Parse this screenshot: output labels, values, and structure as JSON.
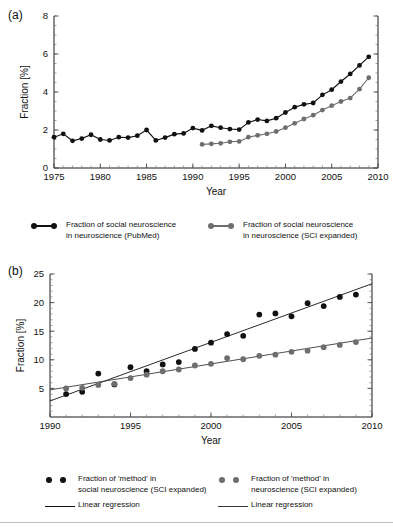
{
  "figure": {
    "panel_a_label": "(a)",
    "panel_b_label": "(b)"
  },
  "legend_a": {
    "items": [
      {
        "name": "legend-pubmed",
        "symbol": "line-with-dots",
        "color": "#111111",
        "label": "Fraction of social neuroscience\nin neuroscience (PubMed)"
      },
      {
        "name": "legend-sci-expanded",
        "symbol": "line-with-dots",
        "color": "#6e6e6e",
        "label": "Fraction of social neuroscience\nin neuroscience (SCI expanded)"
      }
    ]
  },
  "legend_b": {
    "items": [
      {
        "name": "legend-method-social",
        "symbol": "two-dots",
        "color": "#111111",
        "label": "Fraction of 'method' in\nsocial neuroscience (SCI expanded)"
      },
      {
        "name": "legend-method-neuro",
        "symbol": "two-dots",
        "color": "#6e6e6e",
        "label": "Fraction of 'method' in\nneuroscience (SCI expanded)"
      }
    ],
    "regression_items": [
      {
        "name": "legend-regression-social",
        "symbol": "line",
        "color": "#111111",
        "label": "Linear regression"
      },
      {
        "name": "legend-regression-neuro",
        "symbol": "line",
        "color": "#3a3a3a",
        "label": "Linear regression"
      }
    ]
  },
  "chart_data": [
    {
      "id": "panel-a",
      "type": "line",
      "title": "",
      "xlabel": "Year",
      "ylabel": "Fraction [%]",
      "xlim": [
        1975,
        2010
      ],
      "ylim": [
        0,
        8
      ],
      "xticks": [
        1975,
        1980,
        1985,
        1990,
        1995,
        2000,
        2005,
        2010
      ],
      "yticks": [
        0,
        2,
        4,
        6,
        8
      ],
      "xminor_step": 1,
      "yminor_step": 0.5,
      "grid": false,
      "legend_position": "below",
      "series": [
        {
          "name": "Fraction of social neuroscience in neuroscience (PubMed)",
          "color": "#111111",
          "marker": "circle",
          "x": [
            1975,
            1976,
            1977,
            1978,
            1979,
            1980,
            1981,
            1982,
            1983,
            1984,
            1985,
            1986,
            1987,
            1988,
            1989,
            1990,
            1991,
            1992,
            1993,
            1994,
            1995,
            1996,
            1997,
            1998,
            1999,
            2000,
            2001,
            2002,
            2003,
            2004,
            2005,
            2006,
            2007,
            2008,
            2009
          ],
          "y": [
            1.62,
            1.8,
            1.43,
            1.55,
            1.75,
            1.5,
            1.45,
            1.62,
            1.6,
            1.7,
            2.0,
            1.45,
            1.6,
            1.78,
            1.82,
            2.1,
            1.98,
            2.22,
            2.12,
            2.05,
            2.02,
            2.4,
            2.55,
            2.48,
            2.62,
            2.92,
            3.2,
            3.35,
            3.42,
            3.85,
            4.12,
            4.55,
            4.95,
            5.4,
            5.85
          ]
        },
        {
          "name": "Fraction of social neuroscience in neuroscience (SCI expanded)",
          "color": "#6e6e6e",
          "marker": "circle",
          "x": [
            1991,
            1992,
            1993,
            1994,
            1995,
            1996,
            1997,
            1998,
            1999,
            2000,
            2001,
            2002,
            2003,
            2004,
            2005,
            2006,
            2007,
            2008,
            2009
          ],
          "y": [
            1.24,
            1.27,
            1.3,
            1.38,
            1.4,
            1.62,
            1.72,
            1.8,
            1.92,
            2.12,
            2.35,
            2.58,
            2.78,
            3.05,
            3.28,
            3.5,
            3.68,
            4.15,
            4.75
          ]
        }
      ]
    },
    {
      "id": "panel-b",
      "type": "scatter",
      "title": "",
      "xlabel": "Year",
      "ylabel": "Fraction [%]",
      "xlim": [
        1990,
        2010
      ],
      "ylim": [
        0,
        25
      ],
      "xticks": [
        1990,
        1995,
        2000,
        2005,
        2010
      ],
      "yticks": [
        5,
        10,
        15,
        20,
        25
      ],
      "xminor_step": 1,
      "yminor_step": 1,
      "grid": false,
      "legend_position": "below",
      "series": [
        {
          "name": "Fraction of 'method' in social neuroscience (SCI expanded)",
          "color": "#111111",
          "marker": "circle",
          "x": [
            1991,
            1992,
            1993,
            1994,
            1995,
            1996,
            1997,
            1998,
            1999,
            2000,
            2001,
            2002,
            2003,
            2004,
            2005,
            2006,
            2007,
            2008,
            2009
          ],
          "y": [
            4.0,
            4.4,
            7.6,
            5.7,
            8.7,
            8.0,
            9.2,
            9.6,
            11.9,
            13.0,
            14.5,
            14.2,
            17.9,
            18.1,
            17.6,
            19.9,
            19.4,
            21.0,
            21.4
          ]
        },
        {
          "name": "Fraction of 'method' in neuroscience (SCI expanded)",
          "color": "#6e6e6e",
          "marker": "circle",
          "x": [
            1991,
            1992,
            1993,
            1994,
            1995,
            1996,
            1997,
            1998,
            1999,
            2000,
            2001,
            2002,
            2003,
            2004,
            2005,
            2006,
            2007,
            2008,
            2009
          ],
          "y": [
            5.0,
            5.1,
            5.6,
            5.8,
            6.8,
            7.4,
            8.0,
            8.3,
            9.0,
            9.3,
            10.3,
            10.1,
            10.7,
            10.9,
            11.4,
            11.6,
            12.2,
            12.6,
            13.1
          ]
        }
      ],
      "regressions": [
        {
          "name": "Linear regression",
          "color": "#111111",
          "for_series": 0,
          "x": [
            1990,
            2010
          ],
          "y": [
            2.8,
            23.3
          ]
        },
        {
          "name": "Linear regression",
          "color": "#3a3a3a",
          "for_series": 1,
          "x": [
            1990,
            2010
          ],
          "y": [
            4.75,
            13.8
          ]
        }
      ]
    }
  ]
}
